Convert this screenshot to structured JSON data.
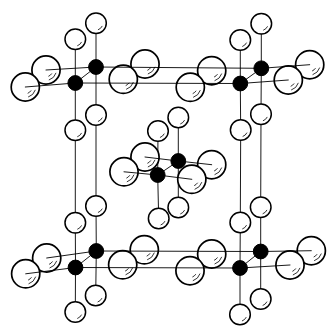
{
  "figure": {
    "canvas": {
      "width": 336,
      "height": 335,
      "background": "#ffffff",
      "ink": "#000000"
    },
    "bond_stroke_width": 0.9,
    "highlight_stroke_width": 0.8,
    "atom_types": {
      "metal": {
        "fill": "#000000",
        "radius": 7.4,
        "stroke_width": 1.0,
        "highlight_arcs": []
      },
      "anion_small": {
        "fill": "#ffffff",
        "radius": 10.3,
        "stroke_width": 1.5,
        "highlight_arcs": [
          [
            0.66,
            26,
            70
          ]
        ]
      },
      "anion_large": {
        "fill": "#ffffff",
        "radius": 14.1,
        "stroke_width": 1.7,
        "highlight_arcs": [
          [
            0.74,
            18,
            72
          ],
          [
            0.48,
            34,
            66
          ]
        ]
      }
    },
    "bonds_under": [
      {
        "id": "vertical-edge-left-back",
        "points": [
          [
            96,
            23.3
          ],
          [
            96,
            67
          ],
          [
            96,
            115
          ],
          [
            96,
            206
          ],
          [
            96.3,
            251
          ],
          [
            95.7,
            295.5
          ]
        ]
      },
      {
        "id": "vertical-edge-left-front",
        "points": [
          [
            75.3,
            39.3
          ],
          [
            75.3,
            83
          ],
          [
            75.3,
            130.3
          ],
          [
            75.3,
            222.8
          ],
          [
            75.5,
            267.5
          ],
          [
            75.3,
            312
          ]
        ]
      },
      {
        "id": "vertical-edge-right-back",
        "points": [
          [
            261.3,
            23.7
          ],
          [
            261.3,
            68.3
          ],
          [
            261,
            114.3
          ],
          [
            260.7,
            207.3
          ],
          [
            260.7,
            251.5
          ],
          [
            260.7,
            299
          ]
        ]
      },
      {
        "id": "vertical-edge-right-front",
        "points": [
          [
            240.3,
            40
          ],
          [
            240.3,
            83.5
          ],
          [
            240.7,
            130
          ],
          [
            240.3,
            222.5
          ],
          [
            240,
            268
          ],
          [
            240,
            314.5
          ]
        ]
      },
      {
        "id": "vertical-center-back",
        "points": [
          [
            178.3,
            117.5
          ],
          [
            178.3,
            161
          ],
          [
            178.3,
            207.5
          ]
        ]
      },
      {
        "id": "vertical-center-front",
        "points": [
          [
            158,
            131
          ],
          [
            157.7,
            175
          ],
          [
            158.7,
            218.5
          ]
        ]
      },
      {
        "id": "depth-edge-top-left",
        "points": [
          [
            75.3,
            83
          ],
          [
            96,
            67
          ]
        ]
      },
      {
        "id": "depth-edge-top-right",
        "points": [
          [
            240.3,
            83.5
          ],
          [
            261.3,
            68.3
          ]
        ]
      },
      {
        "id": "depth-edge-bottom-left",
        "points": [
          [
            75.5,
            267.5
          ],
          [
            96.3,
            251
          ]
        ]
      },
      {
        "id": "depth-edge-bottom-right",
        "points": [
          [
            240,
            268
          ],
          [
            260.7,
            251.5
          ]
        ]
      },
      {
        "id": "depth-edge-center",
        "points": [
          [
            157.7,
            175
          ],
          [
            178.3,
            161
          ]
        ]
      }
    ],
    "bonds_over": [
      {
        "id": "horizontal-top-back",
        "points": [
          [
            46,
            70
          ],
          [
            96,
            67
          ],
          [
            261.3,
            68.3
          ],
          [
            309.7,
            64.7
          ]
        ]
      },
      {
        "id": "horizontal-top-front",
        "points": [
          [
            25.3,
            87
          ],
          [
            75.3,
            83
          ],
          [
            240.3,
            83.5
          ],
          [
            288.3,
            80
          ]
        ]
      },
      {
        "id": "horizontal-bottom-back",
        "points": [
          [
            46.7,
            258
          ],
          [
            96.3,
            251
          ],
          [
            260.7,
            251.5
          ],
          [
            311.3,
            250.7
          ]
        ]
      },
      {
        "id": "horizontal-bottom-front",
        "points": [
          [
            25.7,
            273.8
          ],
          [
            75.5,
            267.5
          ],
          [
            240,
            268
          ],
          [
            290,
            265
          ]
        ]
      },
      {
        "id": "horizontal-center-back",
        "points": [
          [
            145,
            157
          ],
          [
            178.3,
            161
          ],
          [
            211.7,
            164.7
          ]
        ]
      },
      {
        "id": "horizontal-center-front",
        "points": [
          [
            124,
            171.8
          ],
          [
            157.7,
            175
          ],
          [
            191.8,
            179.3
          ]
        ]
      }
    ],
    "atoms": [
      {
        "t": "anion_large",
        "site": "top-left",
        "role": "left-back",
        "x": 46,
        "y": 70
      },
      {
        "t": "anion_large",
        "site": "top-left",
        "role": "right-back",
        "x": 145,
        "y": 64
      },
      {
        "t": "anion_large",
        "site": "top-right",
        "role": "left-back",
        "x": 211.7,
        "y": 70.7
      },
      {
        "t": "anion_large",
        "site": "top-right",
        "role": "right-back",
        "x": 309.7,
        "y": 64.7
      },
      {
        "t": "anion_large",
        "site": "bottom-left",
        "role": "left-back",
        "x": 46.7,
        "y": 258
      },
      {
        "t": "anion_large",
        "site": "bottom-left",
        "role": "right-back",
        "x": 144.3,
        "y": 249.8
      },
      {
        "t": "anion_large",
        "site": "bottom-right",
        "role": "left-back",
        "x": 211.7,
        "y": 254
      },
      {
        "t": "anion_large",
        "site": "bottom-right",
        "role": "right-back",
        "x": 311.3,
        "y": 250.7
      },
      {
        "t": "anion_large",
        "site": "center",
        "role": "left-back",
        "x": 145,
        "y": 157
      },
      {
        "t": "anion_large",
        "site": "center",
        "role": "right-back",
        "x": 211.7,
        "y": 164.7
      },
      {
        "t": "anion_small",
        "site": "top-left",
        "role": "above-back",
        "x": 96,
        "y": 23.3
      },
      {
        "t": "anion_small",
        "site": "top-left",
        "role": "below-back",
        "x": 96,
        "y": 115
      },
      {
        "t": "anion_small",
        "site": "top-right",
        "role": "above-back",
        "x": 261.3,
        "y": 23.7
      },
      {
        "t": "anion_small",
        "site": "top-right",
        "role": "below-back",
        "x": 261,
        "y": 114.3
      },
      {
        "t": "anion_small",
        "site": "bottom-left",
        "role": "above-back",
        "x": 96,
        "y": 206
      },
      {
        "t": "anion_small",
        "site": "bottom-left",
        "role": "below-back",
        "x": 95.7,
        "y": 295.5
      },
      {
        "t": "anion_small",
        "site": "bottom-right",
        "role": "above-back",
        "x": 260.7,
        "y": 207.3
      },
      {
        "t": "anion_small",
        "site": "bottom-right",
        "role": "below-back",
        "x": 260.7,
        "y": 299
      },
      {
        "t": "anion_small",
        "site": "center",
        "role": "above-back",
        "x": 178.3,
        "y": 117.5
      },
      {
        "t": "anion_small",
        "site": "center",
        "role": "below-back",
        "x": 178.3,
        "y": 207.5
      },
      {
        "t": "anion_large",
        "site": "top-left",
        "role": "left-front",
        "x": 25.3,
        "y": 87
      },
      {
        "t": "anion_large",
        "site": "top-left",
        "role": "right-front",
        "x": 123.3,
        "y": 79.3
      },
      {
        "t": "anion_large",
        "site": "top-right",
        "role": "left-front",
        "x": 190.3,
        "y": 87.3
      },
      {
        "t": "anion_large",
        "site": "top-right",
        "role": "right-front",
        "x": 288.3,
        "y": 80
      },
      {
        "t": "anion_large",
        "site": "bottom-left",
        "role": "left-front",
        "x": 25.7,
        "y": 273.8
      },
      {
        "t": "anion_large",
        "site": "bottom-left",
        "role": "right-front",
        "x": 122.7,
        "y": 264.8
      },
      {
        "t": "anion_large",
        "site": "bottom-right",
        "role": "left-front",
        "x": 190,
        "y": 270.7
      },
      {
        "t": "anion_large",
        "site": "bottom-right",
        "role": "right-front",
        "x": 290,
        "y": 265
      },
      {
        "t": "anion_large",
        "site": "center",
        "role": "left-front",
        "x": 124,
        "y": 171.8
      },
      {
        "t": "anion_large",
        "site": "center",
        "role": "right-front",
        "x": 191.8,
        "y": 179.3
      },
      {
        "t": "anion_small",
        "site": "top-left",
        "role": "above-front",
        "x": 75.3,
        "y": 39.3
      },
      {
        "t": "anion_small",
        "site": "top-left",
        "role": "below-front",
        "x": 75.3,
        "y": 130.3
      },
      {
        "t": "anion_small",
        "site": "top-right",
        "role": "above-front",
        "x": 240.3,
        "y": 40
      },
      {
        "t": "anion_small",
        "site": "top-right",
        "role": "below-front",
        "x": 240.7,
        "y": 130
      },
      {
        "t": "anion_small",
        "site": "bottom-left",
        "role": "above-front",
        "x": 75.3,
        "y": 222.8
      },
      {
        "t": "anion_small",
        "site": "bottom-left",
        "role": "below-front",
        "x": 75.3,
        "y": 312
      },
      {
        "t": "anion_small",
        "site": "bottom-right",
        "role": "above-front",
        "x": 240.3,
        "y": 222.5
      },
      {
        "t": "anion_small",
        "site": "bottom-right",
        "role": "below-front",
        "x": 240,
        "y": 314.5
      },
      {
        "t": "anion_small",
        "site": "center",
        "role": "above-front",
        "x": 158,
        "y": 131
      },
      {
        "t": "anion_small",
        "site": "center",
        "role": "below-front",
        "x": 158.7,
        "y": 218.5
      },
      {
        "t": "metal",
        "site": "top-left",
        "role": "back",
        "x": 96,
        "y": 67
      },
      {
        "t": "metal",
        "site": "top-right",
        "role": "back",
        "x": 261.3,
        "y": 68.3
      },
      {
        "t": "metal",
        "site": "bottom-left",
        "role": "back",
        "x": 96.3,
        "y": 251
      },
      {
        "t": "metal",
        "site": "bottom-right",
        "role": "back",
        "x": 260.7,
        "y": 251.5
      },
      {
        "t": "metal",
        "site": "center",
        "role": "back",
        "x": 178.3,
        "y": 161
      },
      {
        "t": "metal",
        "site": "top-left",
        "role": "front",
        "x": 75.3,
        "y": 83
      },
      {
        "t": "metal",
        "site": "top-right",
        "role": "front",
        "x": 240.3,
        "y": 83.5
      },
      {
        "t": "metal",
        "site": "bottom-left",
        "role": "front",
        "x": 75.5,
        "y": 267.5
      },
      {
        "t": "metal",
        "site": "bottom-right",
        "role": "front",
        "x": 240,
        "y": 268
      },
      {
        "t": "metal",
        "site": "center",
        "role": "front",
        "x": 157.7,
        "y": 175
      }
    ]
  }
}
